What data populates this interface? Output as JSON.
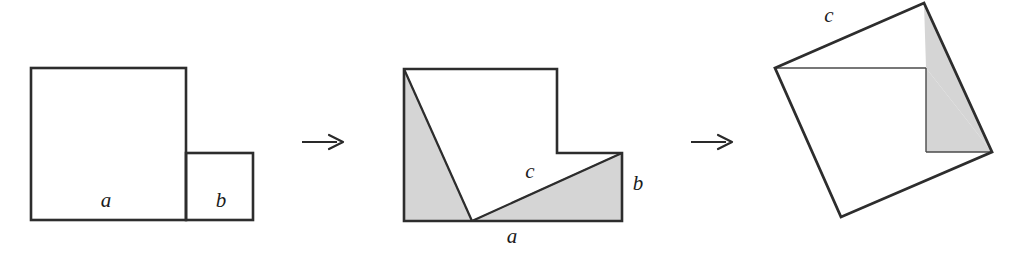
{
  "figure": {
    "background_color": "#ffffff",
    "stroke_color": "#2d2d2d",
    "shade_color": "#d5d5d5",
    "shade_stroke_color": "#6e6e6e",
    "thin_line_color": "#4a4a4a",
    "panels": [
      {
        "name": "two-squares",
        "description": "Large square of side a adjacent to small square of side b",
        "shapes": [
          {
            "name": "square-a",
            "kind": "rect",
            "x": 31,
            "y": 68,
            "width": 155,
            "height": 152,
            "fill": "none"
          },
          {
            "name": "square-b",
            "kind": "rect",
            "x": 186,
            "y": 153,
            "width": 67,
            "height": 67,
            "fill": "none"
          }
        ],
        "labels": [
          {
            "name": "label-a",
            "text": "a",
            "x": 106,
            "y": 207
          },
          {
            "name": "label-b",
            "text": "b",
            "x": 221,
            "y": 207
          }
        ]
      },
      {
        "name": "cut-squares",
        "description": "L-shaped figure formed from both squares with two shaded right triangles cut along hypotenuse c",
        "shapes": [
          {
            "name": "l-shape-outline",
            "kind": "polygon",
            "points": "404,69 557,69 557,153 622,153 622,221 404,221",
            "fill": "none"
          },
          {
            "name": "shaded-triangle-left",
            "kind": "polygon",
            "points": "404,69 404,221 472,221",
            "fill": "shade"
          },
          {
            "name": "shaded-triangle-right",
            "kind": "polygon",
            "points": "472,221 622,221 622,153",
            "fill": "shade"
          },
          {
            "name": "hypotenuse-c-line",
            "kind": "line",
            "x1": 472,
            "y1": 221,
            "x2": 622,
            "y2": 153
          }
        ],
        "labels": [
          {
            "name": "label-c",
            "text": "c",
            "x": 530,
            "y": 178
          },
          {
            "name": "label-b",
            "text": "b",
            "x": 638,
            "y": 190
          },
          {
            "name": "label-a",
            "text": "a",
            "x": 512,
            "y": 243
          }
        ]
      },
      {
        "name": "tilted-square",
        "description": "Rearranged pieces forming a tilted square of side c with one shaded triangle",
        "shapes": [
          {
            "name": "square-c-outline",
            "kind": "polygon",
            "points": "775,68 924,3 992,152 841,217",
            "fill": "none"
          },
          {
            "name": "shaded-triangle",
            "kind": "polygon",
            "points": "926,68 992,152 926,152",
            "fill": "shade"
          },
          {
            "name": "shaded-triangle-upper",
            "kind": "polygon",
            "points": "924,3 992,152 926,68",
            "fill": "shade"
          },
          {
            "name": "horizontal-cut-line",
            "kind": "line",
            "x1": 775,
            "y1": 68,
            "x2": 926,
            "y2": 68
          },
          {
            "name": "vertical-cut-line",
            "kind": "line",
            "x1": 926,
            "y1": 68,
            "x2": 926,
            "y2": 152
          },
          {
            "name": "bottom-cut-line",
            "kind": "line",
            "x1": 926,
            "y1": 152,
            "x2": 992,
            "y2": 152
          }
        ],
        "labels": [
          {
            "name": "label-c",
            "text": "c",
            "x": 829,
            "y": 22
          }
        ]
      }
    ],
    "arrows": [
      {
        "name": "arrow-1",
        "glyph": "→",
        "x": 302,
        "y": 150
      },
      {
        "name": "arrow-2",
        "glyph": "→",
        "x": 691,
        "y": 150
      }
    ]
  }
}
